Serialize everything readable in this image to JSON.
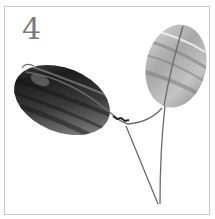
{
  "step": {
    "number": "4"
  },
  "illustration": {
    "subject": "two oval striped stones wrapped with wire, wire legs joined at bottom",
    "colors": {
      "frame_border": "#c9c9c9",
      "background": "#ffffff",
      "numeral": "#7a7a7a",
      "dark_stone": "#2a2a2a",
      "light_stone": "#b5b5b5",
      "wire": "#6a6a6a"
    }
  }
}
